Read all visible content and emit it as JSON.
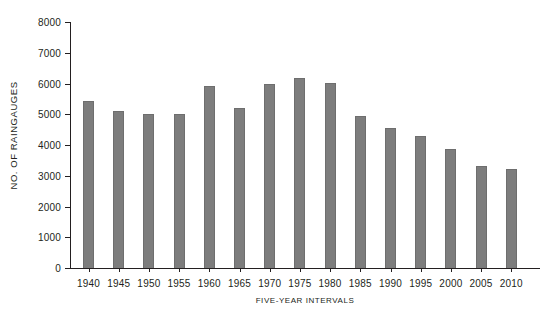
{
  "chart_data": {
    "type": "bar",
    "title": "",
    "xlabel": "FIVE-YEAR INTERVALS",
    "ylabel": "NO. OF RAINGAUGES",
    "categories": [
      "1940",
      "1945",
      "1950",
      "1955",
      "1960",
      "1965",
      "1970",
      "1975",
      "1980",
      "1985",
      "1990",
      "1995",
      "2000",
      "2005",
      "2010"
    ],
    "values": [
      5420,
      5120,
      5000,
      5000,
      5920,
      5200,
      6000,
      6180,
      6020,
      4950,
      4540,
      4300,
      3870,
      3330,
      3230
    ],
    "ylim": [
      0,
      8000
    ],
    "yticks": [
      0,
      1000,
      2000,
      3000,
      4000,
      5000,
      6000,
      7000,
      8000
    ],
    "ytick_labels": [
      "0",
      "1000",
      "2000",
      "3000",
      "4000",
      "5000",
      "6000",
      "7000",
      "8000"
    ],
    "grid": false,
    "legend": false,
    "bar_color": "#7d7d7d",
    "bar_edge_color": "#6e6e6e",
    "axis_color": "#231f20",
    "background_color": "#ffffff"
  }
}
